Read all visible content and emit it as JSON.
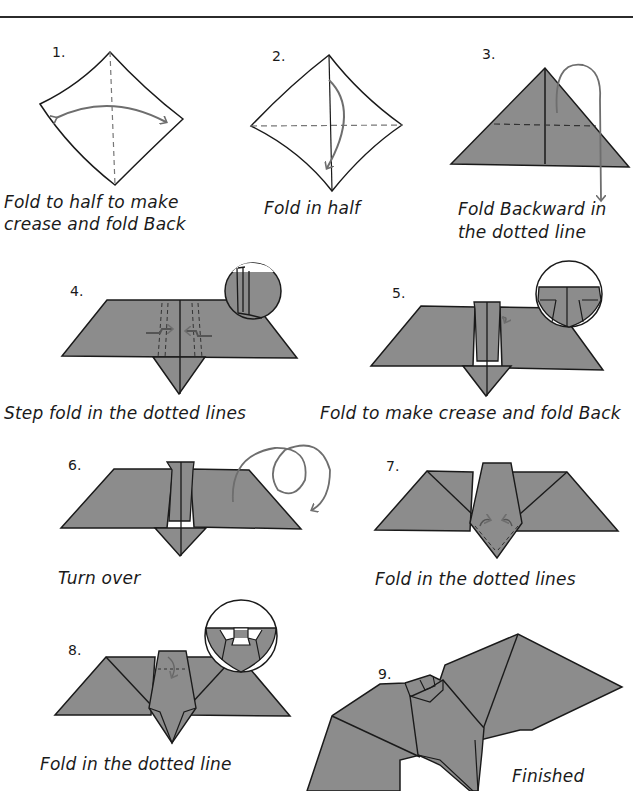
{
  "colors": {
    "paper_fill": "#8c8c8c",
    "stroke": "#1a1a1a",
    "arrow": "#6e6e6e",
    "background": "#ffffff"
  },
  "steps": [
    {
      "number": "1.",
      "caption_line1": "Fold to half to make",
      "caption_line2": "crease and fold Back"
    },
    {
      "number": "2.",
      "caption_line1": "Fold in half",
      "caption_line2": ""
    },
    {
      "number": "3.",
      "caption_line1": "Fold Backward in",
      "caption_line2": "the dotted line"
    },
    {
      "number": "4.",
      "caption_line1": "Step fold in the dotted lines",
      "caption_line2": ""
    },
    {
      "number": "5.",
      "caption_line1": "Fold to make crease and fold Back",
      "caption_line2": ""
    },
    {
      "number": "6.",
      "caption_line1": "Turn over",
      "caption_line2": ""
    },
    {
      "number": "7.",
      "caption_line1": "Fold in the dotted lines",
      "caption_line2": ""
    },
    {
      "number": "8.",
      "caption_line1": "Fold in the dotted line",
      "caption_line2": ""
    },
    {
      "number": "9.",
      "caption_line1": "Finished",
      "caption_line2": ""
    }
  ]
}
